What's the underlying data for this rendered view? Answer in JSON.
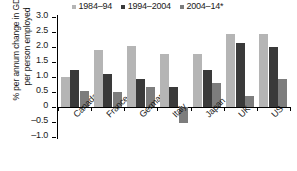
{
  "chart_data": {
    "type": "bar",
    "title": "",
    "xlabel": "",
    "ylabel": "% per annum change in GDP per person employed",
    "ylim": [
      -1.0,
      3.0
    ],
    "ytick_labels": [
      "3.0",
      "2.5",
      "2.0",
      "1.5",
      "1.0",
      "0.5",
      "0",
      "–0.5",
      "–1.0"
    ],
    "ytick_values": [
      3.0,
      2.5,
      2.0,
      1.5,
      1.0,
      0.5,
      0,
      -0.5,
      -1.0
    ],
    "grid": false,
    "legend_position": "top",
    "categories": [
      "Canada",
      "France",
      "Germany",
      "Italy",
      "Japan",
      "UK",
      "US"
    ],
    "series": [
      {
        "name": "1984–94",
        "color": "#b5b5b5",
        "values": [
          1.0,
          1.9,
          2.02,
          1.76,
          1.76,
          2.45,
          2.44
        ]
      },
      {
        "name": "1994–2004",
        "color": "#3a3a3a",
        "values": [
          1.25,
          1.11,
          0.95,
          0.66,
          1.25,
          2.15,
          2.0
        ]
      },
      {
        "name": "2004–14*",
        "color": "#7d7d7d",
        "values": [
          0.55,
          0.5,
          0.68,
          -0.52,
          0.81,
          0.38,
          0.93
        ]
      }
    ]
  },
  "footnote": ""
}
